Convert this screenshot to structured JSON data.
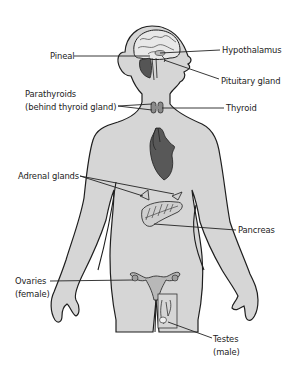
{
  "diagram": {
    "labels": {
      "pineal": "Pineal",
      "hypothalamus": "Hypothalamus",
      "pituitary": "Pituitary gland",
      "parathyroids_line1": "Parathyroids",
      "parathyroids_line2": "(behind thyroid gland)",
      "thyroid": "Thyroid",
      "adrenal": "Adrenal glands",
      "pancreas": "Pancreas",
      "ovaries_line1": "Ovaries",
      "ovaries_line2": "(female)",
      "testes_line1": "Testes",
      "testes_line2": "(male)"
    },
    "colors": {
      "body_fill": "#d6d6d6",
      "outline": "#1e1e1e",
      "organ_dark": "#555555",
      "organ_mid": "#8a8a8a",
      "leader_line": "#222222"
    }
  }
}
